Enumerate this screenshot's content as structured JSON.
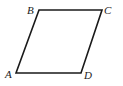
{
  "diagram": {
    "shape": "parallelogram",
    "stroke_color": "#1a1a1a",
    "vertices": [
      {
        "label": "A",
        "x": 16,
        "y": 73,
        "label_x": 5,
        "label_y": 78
      },
      {
        "label": "B",
        "x": 39,
        "y": 10,
        "label_x": 27,
        "label_y": 14
      },
      {
        "label": "C",
        "x": 102,
        "y": 10,
        "label_x": 104,
        "label_y": 14
      },
      {
        "label": "D",
        "x": 81,
        "y": 73,
        "label_x": 84,
        "label_y": 79
      }
    ]
  }
}
